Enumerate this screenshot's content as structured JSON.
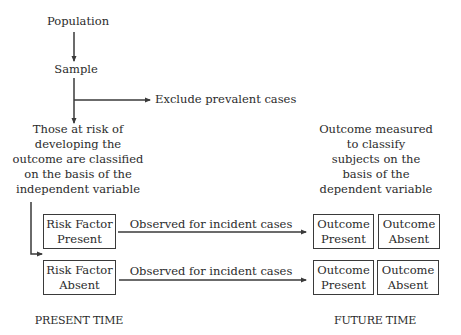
{
  "diagram": {
    "nodes": {
      "population": "Population",
      "sample": "Sample",
      "exclude": "Exclude prevalent cases",
      "at_risk": {
        "lines": [
          "Those at risk of",
          "developing the",
          "outcome are classified",
          "on the basis of the",
          "independent variable"
        ]
      },
      "outcome_measured": {
        "lines": [
          "Outcome measured",
          "to classify",
          "subjects on the",
          "basis of the",
          "dependent variable"
        ]
      },
      "risk_present": {
        "line1": "Risk Factor",
        "line2": "Present"
      },
      "risk_absent": {
        "line1": "Risk Factor",
        "line2": "Absent"
      },
      "row1_outcome_present": {
        "line1": "Outcome",
        "line2": "Present"
      },
      "row1_outcome_absent": {
        "line1": "Outcome",
        "line2": "Absent"
      },
      "row2_outcome_present": {
        "line1": "Outcome",
        "line2": "Present"
      },
      "row2_outcome_absent": {
        "line1": "Outcome",
        "line2": "Absent"
      }
    },
    "edges": {
      "row1_label": "Observed for incident cases",
      "row2_label": "Observed for incident cases"
    },
    "timeline": {
      "present": "PRESENT TIME",
      "future": "FUTURE TIME"
    },
    "colors": {
      "line": "#3a3a3a",
      "text": "#2b2b2b",
      "background": "#ffffff"
    }
  }
}
